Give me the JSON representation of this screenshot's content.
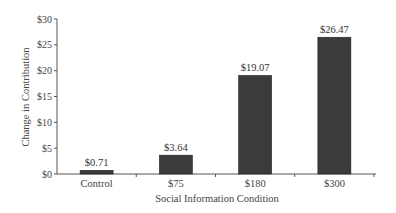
{
  "chart_data": {
    "type": "bar",
    "title": "",
    "xlabel": "Social Information Condition",
    "ylabel": "Change in Contribution",
    "categories": [
      "Control",
      "$75",
      "$180",
      "$300"
    ],
    "values": [
      0.71,
      3.64,
      19.07,
      26.47
    ],
    "value_labels": [
      "$0.71",
      "$3.64",
      "$19.07",
      "$26.47"
    ],
    "ylim": [
      0,
      30
    ],
    "yticks": [
      0,
      5,
      10,
      15,
      20,
      25,
      30
    ],
    "ytick_labels": [
      "$0",
      "$5",
      "$10",
      "$15",
      "$20",
      "$25",
      "$30"
    ],
    "grid": false,
    "legend": null,
    "bar_color": "#3b3b3b"
  }
}
